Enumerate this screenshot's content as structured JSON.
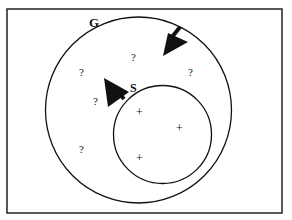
{
  "diagram": {
    "frame": {
      "x": 7,
      "y": 9,
      "w": 275,
      "h": 204
    },
    "outer_set": {
      "label": "G",
      "cx": 138.5,
      "cy": 110,
      "r": 93
    },
    "inner_set": {
      "label": "S",
      "cx": 162.5,
      "cy": 134.5,
      "r": 49
    },
    "unknown_marks": [
      {
        "text": "?",
        "x": 134,
        "y": 61
      },
      {
        "text": "?",
        "x": 82,
        "y": 75
      },
      {
        "text": "?",
        "x": 191,
        "y": 75
      },
      {
        "text": "?",
        "x": 96,
        "y": 104
      },
      {
        "text": "?",
        "x": 82,
        "y": 152
      }
    ],
    "positive_marks": [
      {
        "text": "+",
        "x": 139,
        "y": 116
      },
      {
        "text": "+",
        "x": 179,
        "y": 131
      },
      {
        "text": "+",
        "x": 139,
        "y": 161
      }
    ],
    "arrows": [
      {
        "name": "G-shrink-arrow",
        "direction": "inward"
      },
      {
        "name": "S-grow-arrow",
        "direction": "outward"
      }
    ],
    "colors": {
      "stroke": "#111111",
      "background": "#ffffff"
    }
  }
}
